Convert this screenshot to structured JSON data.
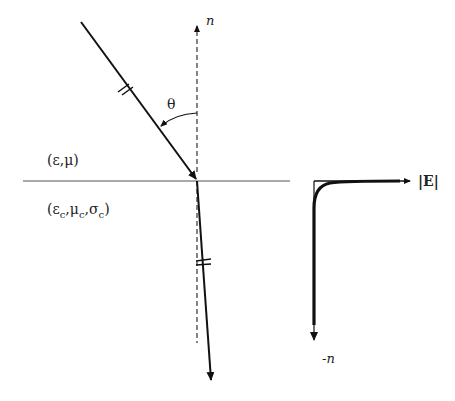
{
  "diagram": {
    "normal_label": "n",
    "angle_label": "θ",
    "upper_medium_label": "(ε,μ)",
    "lower_medium": {
      "open": "(",
      "eps": "ε",
      "mu": "μ",
      "sigma": "σ",
      "sub": "c",
      "comma": ",",
      "close": ")"
    },
    "field_axis_label": "|E|",
    "depth_axis_label": "-n",
    "colors": {
      "line": "#111111",
      "interface": "#555555",
      "dashed": "#333333"
    }
  }
}
